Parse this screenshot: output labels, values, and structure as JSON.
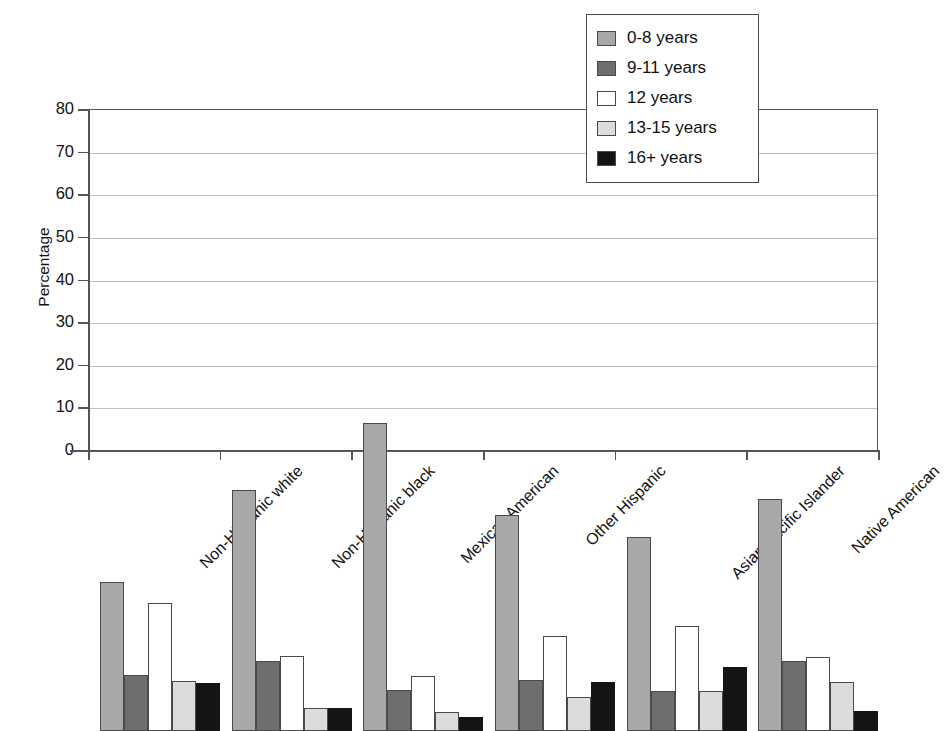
{
  "chart_data": {
    "type": "bar",
    "title": "",
    "xlabel": "",
    "ylabel": "Percentage",
    "ylim": [
      0,
      80
    ],
    "yticks": [
      0,
      10,
      20,
      30,
      40,
      50,
      60,
      70,
      80
    ],
    "grid": true,
    "legend_position": "top-right",
    "categories": [
      "Non-Hispanic white",
      "Non-Hispanic black",
      "Mexican American",
      "Other Hispanic",
      "Asian/Pacific Islander",
      "Native American"
    ],
    "series": [
      {
        "name": "0-8 years",
        "color": "#a8a8a8",
        "values": [
          35.0,
          56.5,
          72.2,
          50.6,
          45.5,
          54.5
        ]
      },
      {
        "name": "9-11 years",
        "color": "#6e6e6e",
        "values": [
          13.1,
          16.4,
          9.7,
          11.9,
          9.4,
          16.4
        ]
      },
      {
        "name": "12 years",
        "color": "#ffffff",
        "values": [
          30.1,
          17.7,
          12.9,
          22.4,
          24.6,
          17.4
        ]
      },
      {
        "name": "13-15 years",
        "color": "#dcdcdc",
        "values": [
          11.8,
          5.5,
          4.4,
          7.9,
          9.5,
          11.6
        ]
      },
      {
        "name": "16+ years",
        "color": "#141414",
        "values": [
          11.3,
          5.5,
          3.4,
          11.4,
          15.0,
          4.8
        ]
      }
    ]
  },
  "legend": {
    "items": [
      {
        "label": "0-8 years"
      },
      {
        "label": "9-11 years"
      },
      {
        "label": "12 years"
      },
      {
        "label": "13-15 years"
      },
      {
        "label": "16+ years"
      }
    ]
  }
}
